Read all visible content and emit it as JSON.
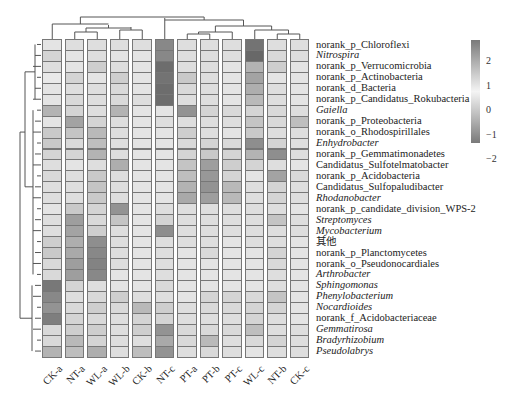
{
  "chart_data": {
    "type": "heatmap",
    "title": "",
    "xlabel": "",
    "ylabel": "",
    "columns": [
      "CK-a",
      "NT-a",
      "WL-a",
      "WL-b",
      "CK-b",
      "NT-c",
      "PT-a",
      "PT-b",
      "PT-c",
      "WL-c",
      "NT-b",
      "CK-c"
    ],
    "rows": [
      {
        "label": "norank_p_Chloroflexi",
        "italic": false
      },
      {
        "label": "Nitrospira",
        "italic": true
      },
      {
        "label": "norank_p_Verrucomicrobia",
        "italic": false
      },
      {
        "label": "norank_p_Actinobacteria",
        "italic": false
      },
      {
        "label": "norank_d_Bacteria",
        "italic": false
      },
      {
        "label": "norank_p_Candidatus_Rokubacteria",
        "italic": false
      },
      {
        "label": "Gaiella",
        "italic": true
      },
      {
        "label": "norank_p_Proteobacteria",
        "italic": false
      },
      {
        "label": "norank_o_Rhodospirillales",
        "italic": false
      },
      {
        "label": "Enhydrobacter",
        "italic": true
      },
      {
        "label": "norank_p_Gemmatimonadetes",
        "italic": false
      },
      {
        "label": "Candidatus_Sulfotelmatobacter",
        "italic": false
      },
      {
        "label": "norank_p_Acidobacteria",
        "italic": false
      },
      {
        "label": "Candidatus_Sulfopaludibacter",
        "italic": false
      },
      {
        "label": "Rhodanobacter",
        "italic": true
      },
      {
        "label": "norank_p_candidate_division_WPS-2",
        "italic": false
      },
      {
        "label": "Streptomyces",
        "italic": true
      },
      {
        "label": "Mycobacterium",
        "italic": true
      },
      {
        "label": "其他",
        "italic": false
      },
      {
        "label": "norank_p_Planctomycetes",
        "italic": false
      },
      {
        "label": "norank_o_Pseudonocardiales",
        "italic": false
      },
      {
        "label": "Arthrobacter",
        "italic": true
      },
      {
        "label": "Sphingomonas",
        "italic": true
      },
      {
        "label": "Phenylobacterium",
        "italic": true
      },
      {
        "label": "Nocardioides",
        "italic": true
      },
      {
        "label": "norank_f_Acidobacteriaceae",
        "italic": false
      },
      {
        "label": "Gemmatirosa",
        "italic": true
      },
      {
        "label": "Bradyrhizobium",
        "italic": true
      },
      {
        "label": "Pseudolabrys",
        "italic": true
      }
    ],
    "values": [
      [
        -0.3,
        -0.4,
        -0.4,
        -0.4,
        -0.4,
        2.0,
        -0.4,
        -0.4,
        -0.4,
        2.4,
        -0.4,
        -0.4
      ],
      [
        -0.6,
        -0.3,
        -0.4,
        -0.3,
        -0.3,
        2.0,
        -0.4,
        -0.4,
        -0.4,
        2.6,
        -0.5,
        -0.4
      ],
      [
        -0.4,
        -0.3,
        -0.7,
        -0.4,
        -0.3,
        2.5,
        -0.4,
        -0.4,
        -0.3,
        1.2,
        -0.7,
        -0.3
      ],
      [
        -0.2,
        -0.6,
        -0.3,
        -0.7,
        -0.3,
        2.4,
        -0.8,
        -0.4,
        -0.3,
        1.5,
        -0.3,
        -0.3
      ],
      [
        -0.3,
        -0.4,
        -0.4,
        -0.5,
        -0.3,
        2.5,
        -0.5,
        -0.4,
        -0.3,
        1.3,
        -0.4,
        -0.3
      ],
      [
        -0.3,
        -0.5,
        -0.4,
        -0.5,
        -0.4,
        2.5,
        -0.4,
        -0.4,
        -0.3,
        1.1,
        -0.4,
        -0.3
      ],
      [
        -1.2,
        -0.6,
        -0.4,
        -1.2,
        -0.3,
        -0.3,
        -1.8,
        -0.6,
        -0.5,
        -0.6,
        -0.5,
        -0.4
      ],
      [
        -0.3,
        -1.5,
        -0.6,
        -0.4,
        -0.3,
        -0.4,
        -0.4,
        -0.4,
        -0.4,
        -0.9,
        -0.5,
        -1.0
      ],
      [
        -0.8,
        -0.9,
        -1.1,
        -0.4,
        -0.3,
        -0.3,
        -0.7,
        -0.4,
        -0.3,
        -0.8,
        -0.4,
        -0.4
      ],
      [
        -0.8,
        -0.5,
        -1.0,
        -0.4,
        -0.3,
        -0.3,
        -0.5,
        -0.6,
        -0.5,
        -1.9,
        -0.6,
        -0.4
      ],
      [
        -0.6,
        -0.6,
        -1.2,
        -0.4,
        -0.3,
        -0.3,
        -0.6,
        -0.8,
        -0.6,
        -1.2,
        -1.9,
        -0.4
      ],
      [
        -0.4,
        -0.3,
        -0.4,
        -1.3,
        -0.3,
        -0.3,
        -0.9,
        -1.6,
        -0.7,
        -0.6,
        -0.4,
        -0.3
      ],
      [
        -0.5,
        -0.4,
        -0.8,
        -0.4,
        -0.3,
        -0.3,
        -1.0,
        -1.7,
        -0.6,
        -0.3,
        -1.5,
        -0.5
      ],
      [
        -0.4,
        -0.4,
        -0.9,
        -0.4,
        -0.3,
        -0.3,
        -1.2,
        -1.8,
        -1.1,
        -0.4,
        -0.6,
        -0.4
      ],
      [
        -0.4,
        -0.4,
        -0.8,
        -0.4,
        -0.3,
        -0.3,
        -1.4,
        -1.6,
        -1.1,
        -0.4,
        -0.6,
        -0.4
      ],
      [
        -0.3,
        -0.8,
        -0.6,
        -1.8,
        -0.3,
        -0.4,
        -0.4,
        -0.4,
        -0.4,
        -0.4,
        -0.4,
        -0.3
      ],
      [
        -0.4,
        -1.6,
        -0.5,
        -0.9,
        -0.3,
        -0.6,
        -0.4,
        -0.4,
        -0.4,
        -0.4,
        -0.9,
        -0.4
      ],
      [
        -0.4,
        -1.5,
        -0.7,
        -0.4,
        -0.3,
        -1.9,
        -0.4,
        -0.4,
        -0.4,
        -0.4,
        -0.4,
        -0.4
      ],
      [
        -0.7,
        -1.3,
        -1.9,
        -0.4,
        -0.3,
        -0.4,
        -0.4,
        -0.4,
        -0.3,
        -0.4,
        -0.4,
        -0.3
      ],
      [
        -0.8,
        -1.4,
        -2.0,
        -0.4,
        -0.3,
        -0.4,
        -0.3,
        -0.5,
        -0.3,
        -0.3,
        -0.6,
        -0.3
      ],
      [
        -0.5,
        -1.6,
        -2.1,
        -0.4,
        -0.3,
        -0.4,
        -0.3,
        -0.3,
        -0.3,
        -0.3,
        -0.5,
        -0.3
      ],
      [
        -0.5,
        -1.6,
        -2.0,
        -0.3,
        -0.3,
        -0.4,
        -0.3,
        -0.3,
        -0.3,
        -0.3,
        -0.4,
        -0.3
      ],
      [
        -2.3,
        -0.6,
        -0.4,
        -0.3,
        -0.3,
        -0.5,
        -0.3,
        -0.3,
        -0.3,
        -0.3,
        -0.4,
        -0.3
      ],
      [
        -2.0,
        -0.4,
        -0.5,
        -0.7,
        -0.4,
        -0.4,
        -0.3,
        -0.6,
        -0.6,
        -0.5,
        -0.9,
        -0.3
      ],
      [
        -1.8,
        -0.5,
        -0.7,
        -0.5,
        -1.1,
        -0.7,
        -0.4,
        -0.5,
        -0.5,
        -0.6,
        -0.6,
        -0.3
      ],
      [
        -2.2,
        -0.6,
        -0.5,
        -0.4,
        -0.6,
        -0.6,
        -0.4,
        -0.4,
        -0.4,
        -0.6,
        -0.4,
        -0.3
      ],
      [
        -0.5,
        -0.7,
        -0.7,
        -0.4,
        -0.7,
        -1.8,
        -0.5,
        -0.5,
        -0.5,
        -1.0,
        -0.4,
        -0.4
      ],
      [
        -0.5,
        -1.1,
        -0.6,
        -0.4,
        -0.4,
        -1.4,
        -0.5,
        -1.1,
        -0.4,
        -0.5,
        -0.6,
        -0.4
      ],
      [
        -1.2,
        -1.0,
        -1.3,
        -0.4,
        -1.0,
        -1.8,
        -0.4,
        -0.5,
        -0.4,
        -0.3,
        -0.4,
        -0.4
      ]
    ],
    "legend": {
      "ticks": [
        2,
        1,
        0,
        -1,
        -2
      ],
      "tick_labels": [
        "2",
        "1",
        "0",
        "−1",
        "−2"
      ],
      "range": [
        -2.6,
        2.6
      ],
      "position": "right"
    },
    "grid": false
  }
}
